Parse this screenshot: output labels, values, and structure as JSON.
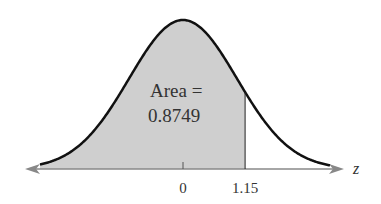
{
  "chart_data": {
    "type": "area",
    "title": "",
    "xlabel": "z",
    "ylabel": "",
    "x_ticks": [
      "0",
      "1.15"
    ],
    "annotation": {
      "line1": "Area =",
      "line2": "0.8749"
    },
    "shaded_region": {
      "from": "-inf",
      "to": 1.15,
      "area": 0.8749
    },
    "mean": 0,
    "std": 1,
    "grid": false,
    "legend": null
  },
  "colors": {
    "shade": "#cfcfcf",
    "curve": "#111111",
    "axis": "#888888"
  }
}
